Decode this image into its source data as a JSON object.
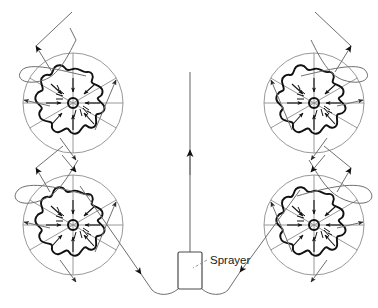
{
  "figure": {
    "kind": "orchard-sprayer-path-diagram",
    "width": 378,
    "height": 308,
    "background_color": "#ffffff",
    "ink_color": "#1a1a1a",
    "thin_line_color": "#8a8a8a",
    "canopy_line_color": "#111111"
  },
  "labels": {
    "sprayer": "Sprayer"
  },
  "sprayer": {
    "name": "sprayer",
    "x": 178,
    "y": 252,
    "width": 24,
    "height": 37,
    "label": "Sprayer",
    "label_x": 210,
    "label_y": 257,
    "leader_from_x": 207,
    "leader_from_y": 260,
    "leader_to_x": 193,
    "leader_to_y": 268
  },
  "center_line": {
    "name": "center-travel-line",
    "x": 190,
    "y_top": 72,
    "y_bottom": 252,
    "arrow_y": 155,
    "arrow_direction": "up"
  },
  "trees": [
    {
      "id": "tree-top-left",
      "cx": 73,
      "cy": 103,
      "outer_radius": 50,
      "canopy_radius": 34,
      "trunk_radius": 5,
      "spoke_count": 6,
      "spray_arrow_count": 8,
      "travel_arrows": [
        "north-east",
        "west",
        "south"
      ]
    },
    {
      "id": "tree-top-right",
      "cx": 314,
      "cy": 103,
      "outer_radius": 50,
      "canopy_radius": 34,
      "trunk_radius": 5,
      "spoke_count": 6,
      "spray_arrow_count": 8,
      "travel_arrows": [
        "north-west",
        "east",
        "south"
      ]
    },
    {
      "id": "tree-bottom-left",
      "cx": 73,
      "cy": 225,
      "outer_radius": 50,
      "canopy_radius": 34,
      "trunk_radius": 5,
      "spoke_count": 6,
      "spray_arrow_count": 8,
      "travel_arrows": [
        "north-east",
        "west",
        "south"
      ]
    },
    {
      "id": "tree-bottom-right",
      "cx": 314,
      "cy": 225,
      "outer_radius": 50,
      "canopy_radius": 34,
      "trunk_radius": 5,
      "spoke_count": 6,
      "spray_arrow_count": 8,
      "travel_arrows": [
        "north-west",
        "east",
        "south"
      ]
    }
  ],
  "paths": [
    {
      "id": "path-exit-top-left",
      "description": "U-turn loop exiting up-left from top-left tree",
      "arrow_direction": "up-left"
    },
    {
      "id": "path-exit-top-right",
      "description": "U-turn loop exiting up-right from top-right tree",
      "arrow_direction": "up-right"
    },
    {
      "id": "path-left-uturn",
      "description": "U-turn loop on left side linking bottom-left tree to top-left tree",
      "arrow_direction": "up-right"
    },
    {
      "id": "path-right-uturn",
      "description": "U-turn loop on right side linking bottom-right tree to top-right tree",
      "arrow_direction": "up-left"
    },
    {
      "id": "path-sprayer-to-bottom-left",
      "description": "Diagonal run from sprayer to bottom-left tree",
      "arrow_direction": "toward-sprayer"
    },
    {
      "id": "path-sprayer-to-bottom-right",
      "description": "Diagonal run from sprayer to bottom-right tree",
      "arrow_direction": "toward-sprayer"
    }
  ]
}
